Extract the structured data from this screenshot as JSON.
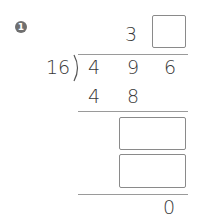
{
  "problem": {
    "number": "1",
    "divisor": "16",
    "dividend": [
      "4",
      "9",
      "6"
    ],
    "quotient": [
      "3",
      ""
    ],
    "first_product": [
      "4",
      "8"
    ],
    "remainder": "0",
    "answer_boxes": [
      "",
      "",
      ""
    ]
  }
}
